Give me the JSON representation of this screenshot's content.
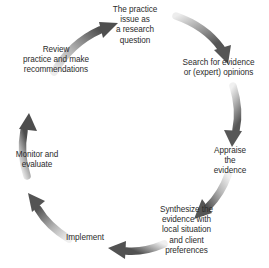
{
  "diagram": {
    "type": "cyclical-process",
    "direction": "clockwise",
    "text_color": "#2b2b2b",
    "arrow_color_dark": "#5a5a5a",
    "arrow_color_light": "#e8e8e8",
    "background": "#ffffff",
    "stages": [
      {
        "id": "practice-issue",
        "order": 1,
        "label": "The practice\nissue as\na research\nquestion",
        "position": "top"
      },
      {
        "id": "search-evidence",
        "order": 2,
        "label": "Search for evidence\nor (expert) opinions",
        "position": "upper-right"
      },
      {
        "id": "appraise-evidence",
        "order": 3,
        "label": "Appraise\nthe\nevidence",
        "position": "right"
      },
      {
        "id": "synthesize-evidence",
        "order": 4,
        "label": "Synthesize the\nevidence with\nlocal situation\nand client\npreferences",
        "position": "lower-right"
      },
      {
        "id": "implement",
        "order": 5,
        "label": "Implement",
        "position": "bottom"
      },
      {
        "id": "monitor-evaluate",
        "order": 6,
        "label": "Monitor and\nevaluate",
        "position": "lower-left"
      },
      {
        "id": "review-recommendations",
        "order": 7,
        "label": "Review\npractice and make\nrecommendations",
        "position": "upper-left"
      }
    ],
    "arrows": [
      {
        "id": "arrow-review-to-practice-issue",
        "from": "review-recommendations",
        "to": "practice-issue"
      },
      {
        "id": "arrow-practice-issue-to-search",
        "from": "practice-issue",
        "to": "search-evidence"
      },
      {
        "id": "arrow-search-to-appraise",
        "from": "search-evidence",
        "to": "appraise-evidence"
      },
      {
        "id": "arrow-appraise-to-synthesize",
        "from": "appraise-evidence",
        "to": "synthesize-evidence"
      },
      {
        "id": "arrow-synthesize-to-implement",
        "from": "synthesize-evidence",
        "to": "implement"
      },
      {
        "id": "arrow-implement-to-monitor",
        "from": "implement",
        "to": "monitor-evaluate"
      },
      {
        "id": "arrow-monitor-to-review",
        "from": "monitor-evaluate",
        "to": "review-recommendations"
      }
    ]
  }
}
